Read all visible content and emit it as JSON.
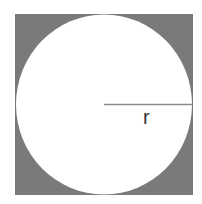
{
  "diagram": {
    "radius_label": "r",
    "colors": {
      "square_fill": "#7a7a7a",
      "circle_fill": "#ffffff",
      "radius_line": "#8a8a8a",
      "label": "#333333"
    }
  }
}
